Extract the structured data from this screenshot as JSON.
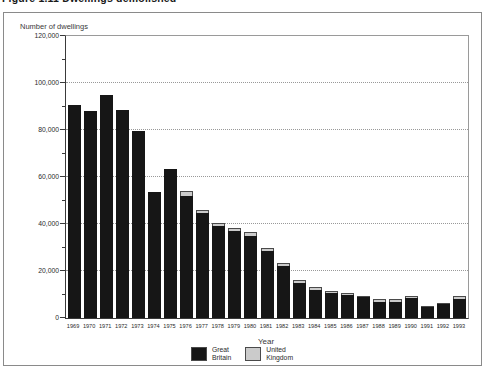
{
  "figure": {
    "title_partial": "Figure 1.11 Dwellings demolished",
    "y_axis_title": "Number of dwellings",
    "x_axis_title": "Year"
  },
  "legend": {
    "items": [
      {
        "series": "great_britain",
        "color": "#161616",
        "line1": "Great",
        "line2": "Britain"
      },
      {
        "series": "united_kingdom",
        "color": "#cbcbcb",
        "line1": "United",
        "line2": "Kingdom"
      }
    ]
  },
  "chart_data": {
    "type": "bar",
    "title": "Figure 1.11 Dwellings demolished",
    "xlabel": "Year",
    "ylabel": "Number of dwellings",
    "ylim": [
      0,
      120000
    ],
    "grid": "dotted-horizontal",
    "gridline_values": [
      20000,
      40000,
      60000,
      80000,
      100000
    ],
    "y_major_ticks": [
      0,
      20000,
      40000,
      60000,
      80000,
      100000,
      120000
    ],
    "y_tick_labels": [
      "0",
      "20,000",
      "40,000",
      "60,000",
      "80,000",
      "100,000",
      "120,000"
    ],
    "y_minor_tick_step": 10000,
    "legend_position": "bottom",
    "bar_style": "overlaid",
    "categories": [
      "1969",
      "1970",
      "1971",
      "1972",
      "1973",
      "1974",
      "1975",
      "1976",
      "1977",
      "1978",
      "1979",
      "1980",
      "1981",
      "1982",
      "1983",
      "1984",
      "1985",
      "1986",
      "1987",
      "1988",
      "1989",
      "1990",
      "1991",
      "1992",
      "1993"
    ],
    "series": [
      {
        "name": "United Kingdom",
        "color": "#cbcbcb",
        "values": [
          90500,
          88000,
          95000,
          88500,
          79500,
          53500,
          63500,
          54000,
          46000,
          40500,
          38500,
          36500,
          30000,
          23500,
          16000,
          13000,
          11500,
          10500,
          9500,
          8000,
          8000,
          9200,
          5300,
          6200,
          9300
        ]
      },
      {
        "name": "Great Britain",
        "color": "#161616",
        "values": [
          90500,
          88000,
          95000,
          88500,
          79500,
          53500,
          63500,
          52000,
          44500,
          39000,
          37000,
          35000,
          28500,
          22000,
          15000,
          12000,
          10500,
          9800,
          8800,
          6800,
          6800,
          8700,
          4500,
          5800,
          8300
        ]
      }
    ]
  }
}
